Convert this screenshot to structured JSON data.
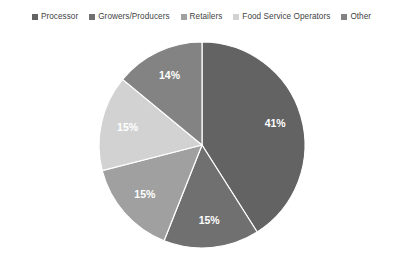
{
  "chart_data": {
    "type": "pie",
    "title": "",
    "subtitle": "",
    "xlabel": "",
    "ylabel": "",
    "grid": false,
    "legend_position": "top",
    "start_angle_deg": 0,
    "direction": "clockwise",
    "categories": [
      "Processor",
      "Growers/Producers",
      "Retailers",
      "Food Service Operators",
      "Other"
    ],
    "values": [
      41,
      15,
      15,
      15,
      14
    ],
    "value_unit": "%",
    "data_labels": [
      "41%",
      "15%",
      "15%",
      "15%",
      "14%"
    ],
    "colors": [
      "#636363",
      "#707070",
      "#a0a0a0",
      "#d2d2d2",
      "#838383"
    ],
    "slices": [
      {
        "label": "Processor",
        "value": 41,
        "data_label": "41%",
        "color": "#636363"
      },
      {
        "label": "Growers/Producers",
        "value": 15,
        "data_label": "15%",
        "color": "#707070"
      },
      {
        "label": "Retailers",
        "value": 15,
        "data_label": "15%",
        "color": "#a0a0a0"
      },
      {
        "label": "Food Service Operators",
        "value": 15,
        "data_label": "15%",
        "color": "#d2d2d2"
      },
      {
        "label": "Other",
        "value": 14,
        "data_label": "14%",
        "color": "#838383"
      }
    ]
  },
  "legend": {
    "items": [
      {
        "label": "Processor",
        "color": "#636363"
      },
      {
        "label": "Growers/Producers",
        "color": "#707070"
      },
      {
        "label": "Retailers",
        "color": "#a0a0a0"
      },
      {
        "label": "Food Service Operators",
        "color": "#d2d2d2"
      },
      {
        "label": "Other",
        "color": "#838383"
      }
    ]
  },
  "style": {
    "background": "#ffffff",
    "label_text_color": "#ffffff",
    "legend_text_color": "#3f3f3f",
    "slice_border_color": "#ffffff"
  },
  "geometry": {
    "center_x": 202,
    "center_y": 119,
    "radius": 103
  }
}
